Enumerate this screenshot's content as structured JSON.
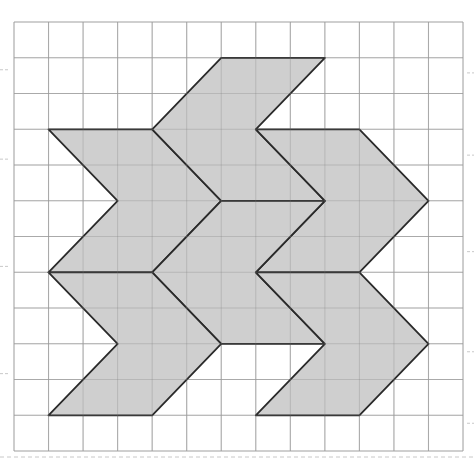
{
  "figure": {
    "grid": {
      "columns": 13,
      "rows": 12,
      "origin_px": [
        14,
        22
      ],
      "cell_w": 34.54,
      "cell_h": 35.75,
      "line_color": "#bdbdbd",
      "tick_color": "#c8c8c8"
    },
    "shape_style": {
      "fill": "#cfcfcf",
      "stroke": "#2a2a2a"
    },
    "shapes": [
      {
        "name": "chevron-upper-left",
        "points": [
          [
            1,
            3
          ],
          [
            4,
            3
          ],
          [
            6,
            5
          ],
          [
            4,
            7
          ],
          [
            1,
            7
          ],
          [
            3,
            5
          ]
        ]
      },
      {
        "name": "chevron-top-center",
        "points": [
          [
            4,
            3
          ],
          [
            6,
            1
          ],
          [
            9,
            1
          ],
          [
            7,
            3
          ],
          [
            9,
            5
          ],
          [
            6,
            5
          ]
        ]
      },
      {
        "name": "chevron-upper-right",
        "points": [
          [
            7,
            3
          ],
          [
            10,
            3
          ],
          [
            12,
            5
          ],
          [
            10,
            7
          ],
          [
            7,
            7
          ],
          [
            9,
            5
          ]
        ]
      },
      {
        "name": "chevron-middle",
        "points": [
          [
            4,
            7
          ],
          [
            6,
            5
          ],
          [
            9,
            5
          ],
          [
            7,
            7
          ],
          [
            9,
            9
          ],
          [
            6,
            9
          ]
        ]
      },
      {
        "name": "chevron-lower-left",
        "points": [
          [
            1,
            7
          ],
          [
            4,
            7
          ],
          [
            6,
            9
          ],
          [
            4,
            11
          ],
          [
            1,
            11
          ],
          [
            3,
            9
          ]
        ]
      },
      {
        "name": "chevron-lower-right",
        "points": [
          [
            7,
            7
          ],
          [
            10,
            7
          ],
          [
            12,
            9
          ],
          [
            10,
            11
          ],
          [
            7,
            11
          ],
          [
            9,
            9
          ]
        ]
      }
    ]
  }
}
